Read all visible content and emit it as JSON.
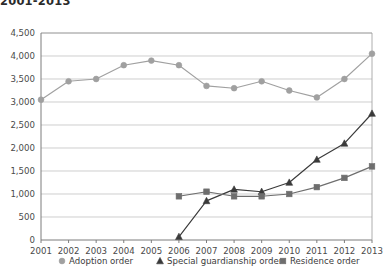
{
  "chart_data": {
    "type": "line",
    "title": "2001-2013",
    "xlabel": "",
    "ylabel": "",
    "x": [
      2001,
      2002,
      2003,
      2004,
      2005,
      2006,
      2007,
      2008,
      2009,
      2010,
      2011,
      2012,
      2013
    ],
    "categories": [
      "2001",
      "2002",
      "2003",
      "2004",
      "2005",
      "2006",
      "2007",
      "2008",
      "2009",
      "2010",
      "2011",
      "2012",
      "2013"
    ],
    "ylim": [
      0,
      4500
    ],
    "yticks": [
      0,
      500,
      1000,
      1500,
      2000,
      2500,
      3000,
      3500,
      4000,
      4500
    ],
    "ytick_labels": [
      "0",
      "500",
      "1,000",
      "1,500",
      "2,000",
      "2,500",
      "3,000",
      "3,500",
      "4,000",
      "4,500"
    ],
    "grid": true,
    "legend_position": "bottom",
    "series": [
      {
        "name": "Adoption order",
        "marker": "circle",
        "color": "#a0a0a0",
        "values": [
          3050,
          3450,
          3500,
          3800,
          3900,
          3800,
          3350,
          3300,
          3450,
          3250,
          3100,
          3500,
          4050
        ]
      },
      {
        "name": "Special guardianship order",
        "marker": "triangle",
        "color": "#3a3a3a",
        "values": [
          null,
          null,
          null,
          null,
          null,
          70,
          850,
          1100,
          1050,
          1250,
          1750,
          2100,
          2750
        ]
      },
      {
        "name": "Residence order",
        "marker": "square",
        "color": "#6e6e6e",
        "values": [
          null,
          null,
          null,
          null,
          null,
          950,
          1050,
          950,
          950,
          1000,
          1150,
          1350,
          1600
        ]
      }
    ]
  },
  "legend": {
    "items": [
      {
        "label": "Adoption order",
        "marker": "circle",
        "color": "#a0a0a0"
      },
      {
        "label": "Special guardianship order",
        "marker": "triangle",
        "color": "#3a3a3a"
      },
      {
        "label": "Residence order",
        "marker": "square",
        "color": "#6e6e6e"
      }
    ]
  }
}
